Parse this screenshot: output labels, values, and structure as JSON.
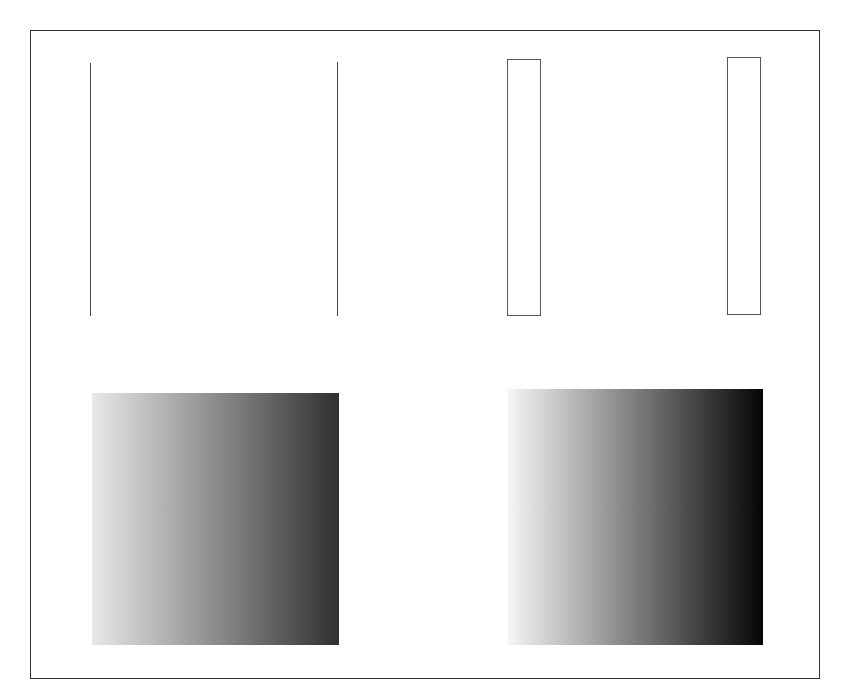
{
  "canvas": {
    "width": 842,
    "height": 691,
    "background": "#ffffff"
  },
  "frame": {
    "border_color": "#333333"
  },
  "vertical_lines": [
    {
      "id": "line-1",
      "x": 90,
      "y1": 63,
      "y2": 316,
      "color": "#444444"
    },
    {
      "id": "line-2",
      "x": 337,
      "y1": 62,
      "y2": 316,
      "color": "#444444"
    }
  ],
  "rectangles": [
    {
      "id": "rect-1",
      "x": 507,
      "y": 59,
      "width": 34,
      "height": 257,
      "stroke": "#555555",
      "fill": "#ffffff"
    },
    {
      "id": "rect-2",
      "x": 727,
      "y": 57,
      "width": 34,
      "height": 258,
      "stroke": "#555555",
      "fill": "#ffffff"
    }
  ],
  "gradients": [
    {
      "id": "gradient-1",
      "x": 92,
      "y": 393,
      "width": 247,
      "height": 252,
      "direction": "to right",
      "start_color": "#e8e8e8",
      "end_color": "#303030"
    },
    {
      "id": "gradient-2",
      "x": 508,
      "y": 389,
      "width": 255,
      "height": 256,
      "direction": "to right",
      "start_color": "#f5f5f5",
      "end_color": "#050505"
    }
  ]
}
